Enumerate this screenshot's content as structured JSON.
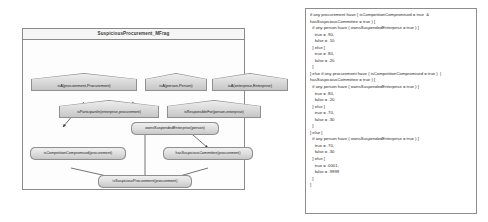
{
  "diagram": {
    "title": "SuspiciousProcurement_MFrag",
    "nodes": [
      {
        "id": "ctx-procurement",
        "type": "context",
        "label": "isA(procurement,Procurement)"
      },
      {
        "id": "ctx-person",
        "type": "context",
        "label": "isA(person,Person)"
      },
      {
        "id": "ctx-enterprise",
        "type": "context",
        "label": "isA(enterprise,Enterprise)"
      },
      {
        "id": "ctx-participantin",
        "type": "context",
        "label": "isParticipantIn(enterprise,procurement)"
      },
      {
        "id": "ctx-responsiblefor",
        "type": "context",
        "label": "isResponsibleFor(person,enterprise)"
      },
      {
        "id": "res-ownssuspended",
        "type": "resident",
        "label": "ownsSuspendedEnterprise(person)"
      },
      {
        "id": "res-competition",
        "type": "resident",
        "label": "isCompetitionCompromised(procurement)"
      },
      {
        "id": "res-committee",
        "type": "resident",
        "label": "hasSuspiciousCommittee(procurement)"
      },
      {
        "id": "res-suspicious",
        "type": "resident",
        "label": "isSuspiciousProcurement(procurement)"
      }
    ]
  },
  "script": {
    "text": "if any procurement have ( isCompetitionCompromised = true  &\nhasSuspiciousCommittee = true ) [\n  if any person have ( ownsSuspendedEnterprise = true ) [\n    true = .90,\n    false = .10\n  ] else [\n    true = .80,\n    false = .20\n  ]\n] else if any procurement have ( isCompetitionCompromised = true )  |\nhasSuspiciousCommittee = true ) [\n  if any person have ( ownsSuspendedEnterprise = true ) [\n    true = .80,\n    false = .20\n  ] else [\n    true = .70,\n    false = .30\n  ]\n] else [\n  if any person have ( ownsSuspendedEnterprise = true ) [\n    true = .70,\n    false = .30\n  ] else [\n    true = .0001,\n    false = .9999\n  ]\n]"
  }
}
